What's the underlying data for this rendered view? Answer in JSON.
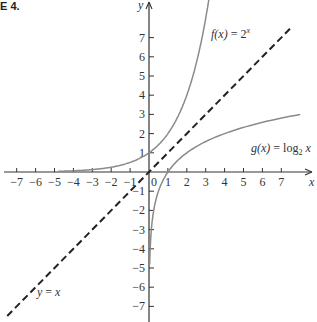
{
  "figure": {
    "label": "E 4."
  },
  "chart_data": {
    "type": "line",
    "title": "",
    "xlabel": "x",
    "ylabel": "y",
    "xlim": [
      -7.5,
      8.5
    ],
    "ylim": [
      -7.5,
      9
    ],
    "grid": false,
    "x_ticks": [
      -7,
      -6,
      -5,
      -4,
      -3,
      -2,
      -1,
      0,
      1,
      2,
      3,
      4,
      5,
      6,
      7
    ],
    "y_ticks": [
      -7,
      -6,
      -5,
      -4,
      -3,
      -2,
      -1,
      1,
      2,
      3,
      4,
      5,
      6,
      7
    ],
    "origin_label": "0",
    "series": [
      {
        "name": "f(x) = 2^x",
        "style": "solid",
        "color": "#8a8a8a",
        "x": [
          -4.8,
          -4,
          -3,
          -2,
          -1,
          0,
          1,
          2,
          2.5,
          3,
          3.3
        ],
        "y": [
          0.04,
          0.06,
          0.13,
          0.25,
          0.5,
          1,
          2,
          4,
          5.66,
          8,
          9.85
        ]
      },
      {
        "name": "g(x) = log2 x",
        "style": "solid",
        "color": "#8a8a8a",
        "x": [
          0.04,
          0.06,
          0.13,
          0.25,
          0.5,
          1,
          2,
          4,
          5.66,
          8
        ],
        "y": [
          -4.8,
          -4,
          -3,
          -2,
          -1,
          0,
          1,
          2,
          2.5,
          3
        ]
      },
      {
        "name": "y = x",
        "style": "dashed",
        "color": "#222222",
        "x": [
          -7.5,
          7.6
        ],
        "y": [
          -7.5,
          7.6
        ]
      }
    ],
    "annotations": [
      {
        "text": "f(x) = 2^x",
        "x": 3.4,
        "y": 7
      },
      {
        "text": "g(x) = log2 x",
        "x": 5.7,
        "y": 1.3
      },
      {
        "text": "y = x",
        "x": -6.2,
        "y": -6.2
      }
    ]
  },
  "labels": {
    "f_lhs": "f(x)",
    "f_eq": " = 2",
    "f_sup": "x",
    "g_lhs": "g(x)",
    "g_eq": " = log",
    "g_sub": "2",
    "g_x": " x",
    "id_lhs": "y",
    "id_eq": " = ",
    "id_rhs": "x",
    "x_axis": "x",
    "y_axis": "y",
    "origin": "0"
  }
}
